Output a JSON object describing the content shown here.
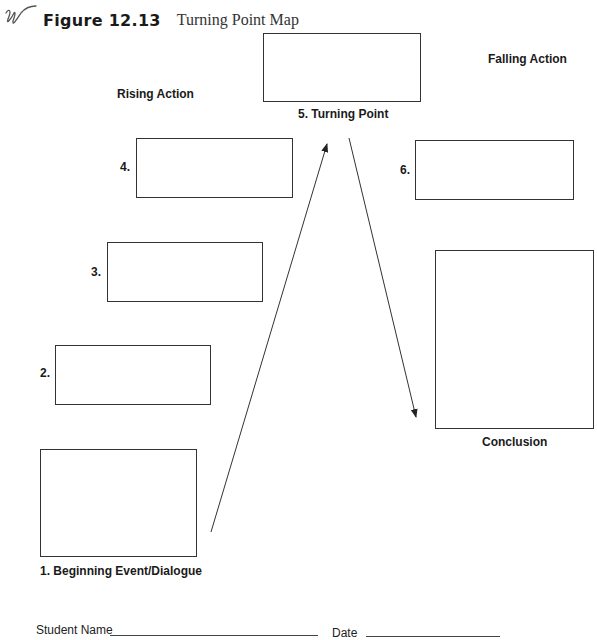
{
  "header": {
    "logo_icon": "scribble-logo-icon",
    "figure_number": "Figure 12.13",
    "figure_title": "Turning Point Map"
  },
  "sections": {
    "rising_action": "Rising Action",
    "falling_action": "Falling Action"
  },
  "boxes": [
    {
      "id": "1",
      "number": "",
      "label": "1. Beginning Event/Dialogue",
      "value": ""
    },
    {
      "id": "2",
      "number": "2.",
      "label": "",
      "value": ""
    },
    {
      "id": "3",
      "number": "3.",
      "label": "",
      "value": ""
    },
    {
      "id": "4",
      "number": "4.",
      "label": "",
      "value": ""
    },
    {
      "id": "5",
      "number": "",
      "label": "5. Turning Point",
      "value": ""
    },
    {
      "id": "6",
      "number": "6.",
      "label": "",
      "value": ""
    },
    {
      "id": "conclusion",
      "number": "",
      "label": "Conclusion",
      "value": ""
    }
  ],
  "arrows": [
    {
      "from": "1. Beginning Event/Dialogue",
      "to": "5. Turning Point",
      "direction": "up"
    },
    {
      "from": "5. Turning Point",
      "to": "Conclusion",
      "direction": "down"
    }
  ],
  "footer": {
    "student_name_label": "Student Name",
    "student_name_value": "",
    "date_label": "Date",
    "date_value": ""
  },
  "colors": {
    "stroke": "#333333",
    "text": "#1a1a1a",
    "background": "#ffffff"
  }
}
